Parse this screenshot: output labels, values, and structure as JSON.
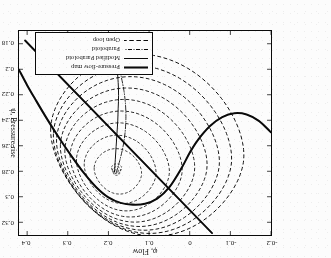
{
  "chart_data": {
    "type": "line",
    "title": "",
    "xlabel": "φ, Flow",
    "ylabel": "ψ, Pressure rise",
    "xlim": [
      -0.2,
      0.42
    ],
    "ylim": [
      0.17,
      0.33
    ],
    "xticks": [
      -0.2,
      -0.1,
      0,
      0.1,
      0.2,
      0.3,
      0.4
    ],
    "xticklabels": [
      "-0.2",
      "-0.1",
      "0",
      "0.1",
      "0.2",
      "0.3",
      "0.4"
    ],
    "yticks": [
      0.18,
      0.2,
      0.22,
      0.24,
      0.26,
      0.28,
      0.3,
      0.32
    ],
    "yticklabels": [
      "0.18",
      "0.2",
      "0.22",
      "0.24",
      "0.26",
      "0.28",
      "0.3",
      "0.32"
    ],
    "grid": false,
    "orientation": "rotated-180",
    "legend_position": "lower-right-of-rotated-figure",
    "legend": [
      {
        "label": "Pressure-flow map",
        "style": "solid-thick"
      },
      {
        "label": "Modified Paraboloid",
        "style": "solid-thin"
      },
      {
        "label": "Paraboloid",
        "style": "dash-dot"
      },
      {
        "label": "Open loop",
        "style": "dashed"
      }
    ],
    "series": [
      {
        "name": "Pressure-flow map",
        "style": "solid-thick",
        "points": [
          [
            -0.2,
            0.2495
          ],
          [
            -0.17,
            0.2405
          ],
          [
            -0.14,
            0.2355
          ],
          [
            -0.11,
            0.2345
          ],
          [
            -0.08,
            0.2375
          ],
          [
            -0.05,
            0.2445
          ],
          [
            -0.02,
            0.2555
          ],
          [
            0.0,
            0.2655
          ],
          [
            0.02,
            0.2775
          ],
          [
            0.05,
            0.2925
          ],
          [
            0.08,
            0.3015
          ],
          [
            0.11,
            0.3055
          ],
          [
            0.14,
            0.3062
          ],
          [
            0.17,
            0.3048
          ],
          [
            0.2,
            0.3005
          ],
          [
            0.23,
            0.2925
          ],
          [
            0.26,
            0.2815
          ],
          [
            0.29,
            0.2685
          ],
          [
            0.32,
            0.2545
          ],
          [
            0.35,
            0.2395
          ],
          [
            0.38,
            0.2235
          ],
          [
            0.4,
            0.2125
          ],
          [
            0.42,
            0.2005
          ]
        ]
      },
      {
        "name": "Throttle line",
        "style": "solid-thick-straight",
        "points": [
          [
            -0.055,
            0.3285
          ],
          [
            0.405,
            0.1775
          ]
        ]
      },
      {
        "name": "Modified Paraboloid",
        "style": "solid-thin",
        "points": [
          [
            0.185,
            0.2805
          ],
          [
            0.183,
            0.2705
          ],
          [
            0.181,
            0.2605
          ],
          [
            0.179,
            0.2505
          ],
          [
            0.177,
            0.2405
          ],
          [
            0.176,
            0.2305
          ],
          [
            0.175,
            0.2205
          ],
          [
            0.176,
            0.2105
          ],
          [
            0.178,
            0.2015
          ]
        ]
      },
      {
        "name": "Paraboloid",
        "style": "dash-dot",
        "points": [
          [
            0.181,
            0.2815
          ],
          [
            0.172,
            0.2715
          ],
          [
            0.164,
            0.2605
          ],
          [
            0.159,
            0.2495
          ],
          [
            0.157,
            0.2385
          ],
          [
            0.158,
            0.2275
          ],
          [
            0.162,
            0.2165
          ],
          [
            0.168,
            0.2065
          ],
          [
            0.173,
            0.1985
          ]
        ]
      },
      {
        "name": "Open loop limit cycles",
        "style": "dashed",
        "count": 9,
        "description": "Family of nested closed surge cycles spiralling outward from the equilibrium near (0.18, 0.281) toward the largest deep-surge loop"
      }
    ],
    "equilibrium_point": [
      0.18,
      0.281
    ]
  },
  "legend": {
    "items": [
      {
        "label": "Pressure-flow map"
      },
      {
        "label": "Modified Paraboloid"
      },
      {
        "label": "Paraboloid"
      },
      {
        "label": "Open loop"
      }
    ]
  },
  "axes": {
    "x_label": "φ, Flow",
    "y_label": "ψ, Pressure rise",
    "x_ticklabels": [
      "-0.2",
      "-0.1",
      "0",
      "0.1",
      "0.2",
      "0.3",
      "0.4"
    ],
    "y_ticklabels": [
      "0.18",
      "0.2",
      "0.22",
      "0.24",
      "0.26",
      "0.28",
      "0.3",
      "0.32"
    ]
  },
  "colors": {
    "ink": "#111111",
    "paper": "#ffffff"
  }
}
